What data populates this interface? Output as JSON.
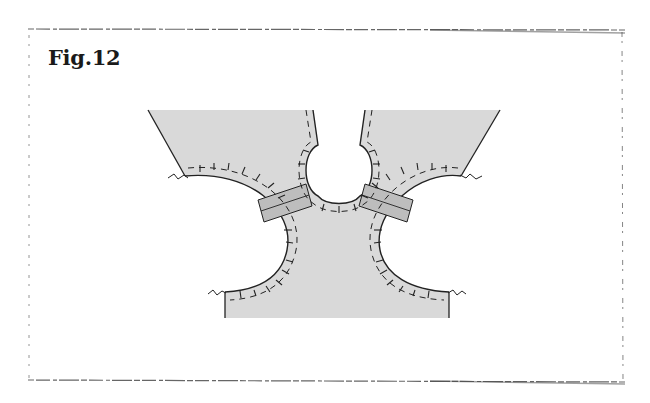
{
  "figure": {
    "title": "Fig.12"
  },
  "colors": {
    "fabric_fill": "#d9d9d9",
    "strip_fill": "#bdbdbd",
    "line": "#222222",
    "frame": "#555555",
    "background": "#ffffff"
  },
  "diagram": {
    "parts": [
      "left-shoulder-panel",
      "right-shoulder-panel",
      "neckline",
      "left-armhole",
      "right-armhole",
      "left-shoulder-strip",
      "right-shoulder-strip",
      "lower-bodice"
    ]
  }
}
